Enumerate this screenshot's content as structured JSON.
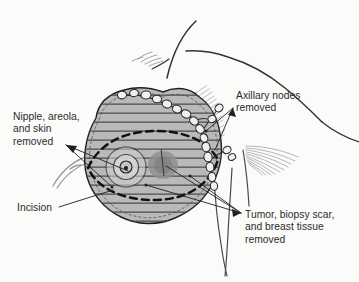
{
  "figure": {
    "background_color": "#fbfbfa",
    "ink_color": "#2b2b2b",
    "text_color": "#2b2b2b"
  },
  "annotations": [
    {
      "id": "nipple",
      "name": "nipple-areola-skin-label",
      "lines": [
        "Nipple, areola,",
        "and skin",
        "removed"
      ],
      "text": "Nipple, areola, and skin removed",
      "position": "left",
      "leader_count": 2
    },
    {
      "id": "axillary",
      "name": "axillary-nodes-label",
      "lines": [
        "Axillary nodes",
        "removed"
      ],
      "text": "Axillary nodes removed",
      "position": "top-right",
      "leader_count": 2
    },
    {
      "id": "incision",
      "name": "incision-label",
      "lines": [
        "Incision"
      ],
      "text": "Incision",
      "position": "bottom-left",
      "leader_count": 1
    },
    {
      "id": "tumor",
      "name": "tumor-biopsy-breast-tissue-label",
      "lines": [
        "Tumor, biopsy scar,",
        "and breast tissue",
        "removed"
      ],
      "text": "Tumor, biopsy scar, and breast tissue removed",
      "position": "bottom-right",
      "leader_count": 3
    }
  ],
  "anatomy": {
    "breast": {
      "name": "breast-mound",
      "fill_color": "#b9b9b9",
      "hatch_line_color": "#4a4a4a",
      "hatch_line_count": 14,
      "outline_color": "#1f1f1f"
    },
    "areola": {
      "name": "nipple-areola",
      "ring_color": "#1f1f1f",
      "fill_color": "#d8d8d8",
      "rings": 3
    },
    "tumor": {
      "name": "tumor-mass",
      "fill_color": "#8c8c8c",
      "scar_color": "#4a4a4a"
    },
    "incision_ellipse": {
      "name": "incision-dashed-ellipse",
      "stroke_color": "#111111",
      "style": "dashed",
      "dash_pattern": "7 5"
    },
    "lymph_nodes": {
      "name": "axillary-lymph-node-chain",
      "count": 19,
      "fill_color": "#eeeeee",
      "outline_color": "#2b2b2b"
    },
    "muscle_fibers": {
      "name": "pectoral-muscle-fibers",
      "stroke_color": "#9a9a9a"
    },
    "torso_outline": {
      "name": "torso-contour",
      "stroke_color": "#2b2b2b"
    }
  }
}
